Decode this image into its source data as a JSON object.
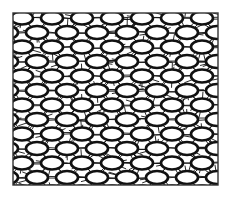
{
  "figure": {
    "frame": {
      "x": 13,
      "y": 13,
      "width": 205,
      "height": 172
    },
    "colors": {
      "stroke": "#111111",
      "background": "#ffffff",
      "frame": "#333333"
    },
    "ellipse": {
      "rx": 11,
      "ry": 6.5,
      "stroke_width": 2.6
    },
    "grid": {
      "col_spacing": 30,
      "row_spacing": 14.5,
      "row_offset": 15,
      "start_x": 22,
      "start_y": 18,
      "rows": 12,
      "cols": 8
    }
  }
}
